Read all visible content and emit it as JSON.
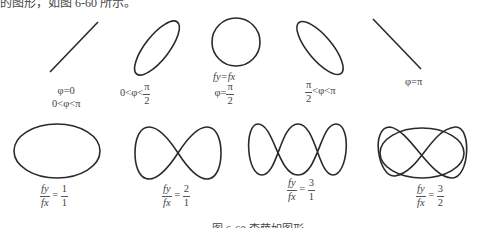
{
  "top_text": "的图形，如图 6-60 所示。",
  "caption": "图 6-60  李萨如图形",
  "row1": [
    {
      "label_lines": [
        "φ=0",
        "0<φ<π"
      ],
      "shape": "line-positive-slope"
    },
    {
      "label": {
        "left": "0<φ<",
        "num": "π",
        "den": "2"
      },
      "shape": "ellipse-tilted-right"
    },
    {
      "label": {
        "top": "fy=fx",
        "left": "φ=",
        "num": "π",
        "den": "2"
      },
      "shape": "circle"
    },
    {
      "label": {
        "num": "π",
        "den": "2",
        "right": "<φ<π"
      },
      "shape": "ellipse-tilted-left"
    },
    {
      "label": "φ=π",
      "shape": "line-negative-slope"
    }
  ],
  "row2": [
    {
      "ratio": {
        "num": "fy",
        "den": "fx",
        "rnum": "1",
        "rden": "1"
      },
      "shape": "ellipse"
    },
    {
      "ratio": {
        "num": "fy",
        "den": "fx",
        "rnum": "2",
        "rden": "1"
      },
      "shape": "figure-eight"
    },
    {
      "ratio": {
        "num": "fy",
        "den": "fx",
        "rnum": "3",
        "rden": "1"
      },
      "shape": "three-lobe"
    },
    {
      "ratio": {
        "num": "fy",
        "den": "fx",
        "rnum": "3",
        "rden": "2"
      },
      "shape": "lissajous-3-2"
    }
  ]
}
